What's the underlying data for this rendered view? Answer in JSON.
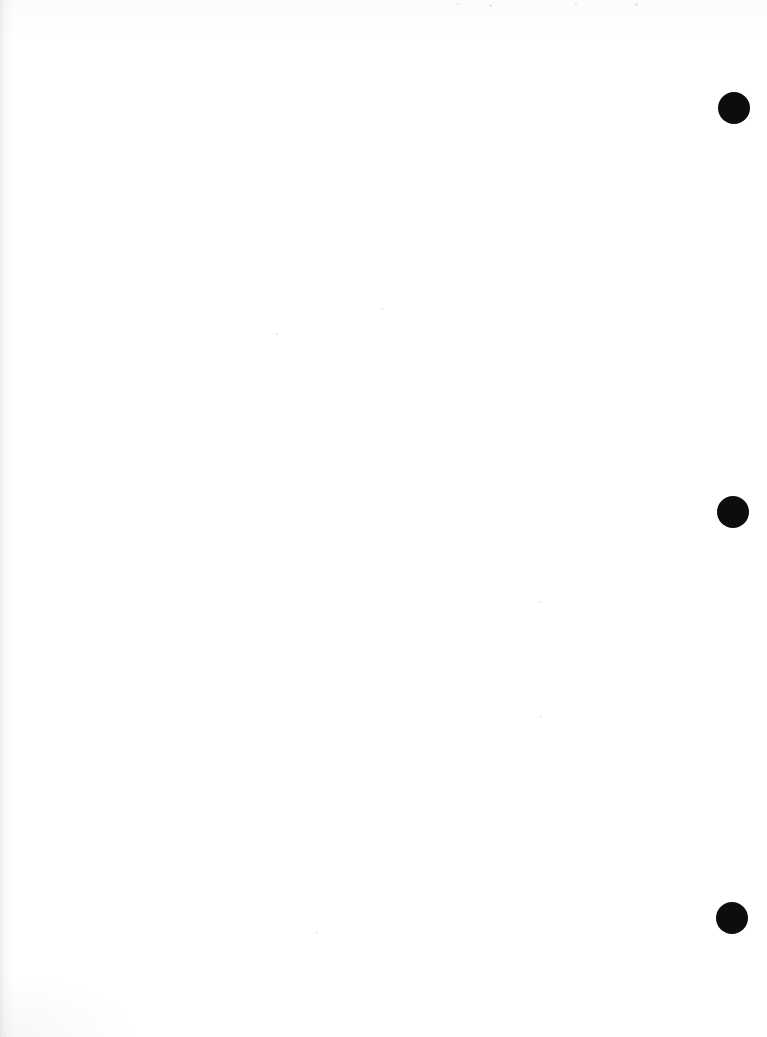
{
  "page": {
    "kind": "scanned-blank-page",
    "width": 767,
    "height": 1037,
    "background_color": "#ffffff",
    "body_text": "",
    "visible_text": ""
  },
  "marks": {
    "color": "#0d0d0d",
    "shape": "filled-circle",
    "diameter": 32,
    "items": [
      {
        "label": "register-mark-top",
        "cx": 734,
        "cy": 108
      },
      {
        "label": "register-mark-middle",
        "cx": 733,
        "cy": 512
      },
      {
        "label": "register-mark-bottom",
        "cx": 732,
        "cy": 918
      }
    ]
  },
  "artifacts": {
    "left_edge_shadow_color": "#8c8c94",
    "left_edge_shadow_width": 13,
    "speck_color": "#aaaab2",
    "specks": [
      {
        "x": 381,
        "y": 308,
        "size": 2
      },
      {
        "x": 276,
        "y": 333,
        "size": 2
      },
      {
        "x": 539,
        "y": 601,
        "size": 2
      },
      {
        "x": 540,
        "y": 716,
        "size": 2
      },
      {
        "x": 316,
        "y": 932,
        "size": 2
      },
      {
        "x": 457,
        "y": 3,
        "size": 2
      },
      {
        "x": 489,
        "y": 4,
        "size": 3
      },
      {
        "x": 575,
        "y": 3,
        "size": 2
      },
      {
        "x": 635,
        "y": 3,
        "size": 3
      }
    ]
  }
}
